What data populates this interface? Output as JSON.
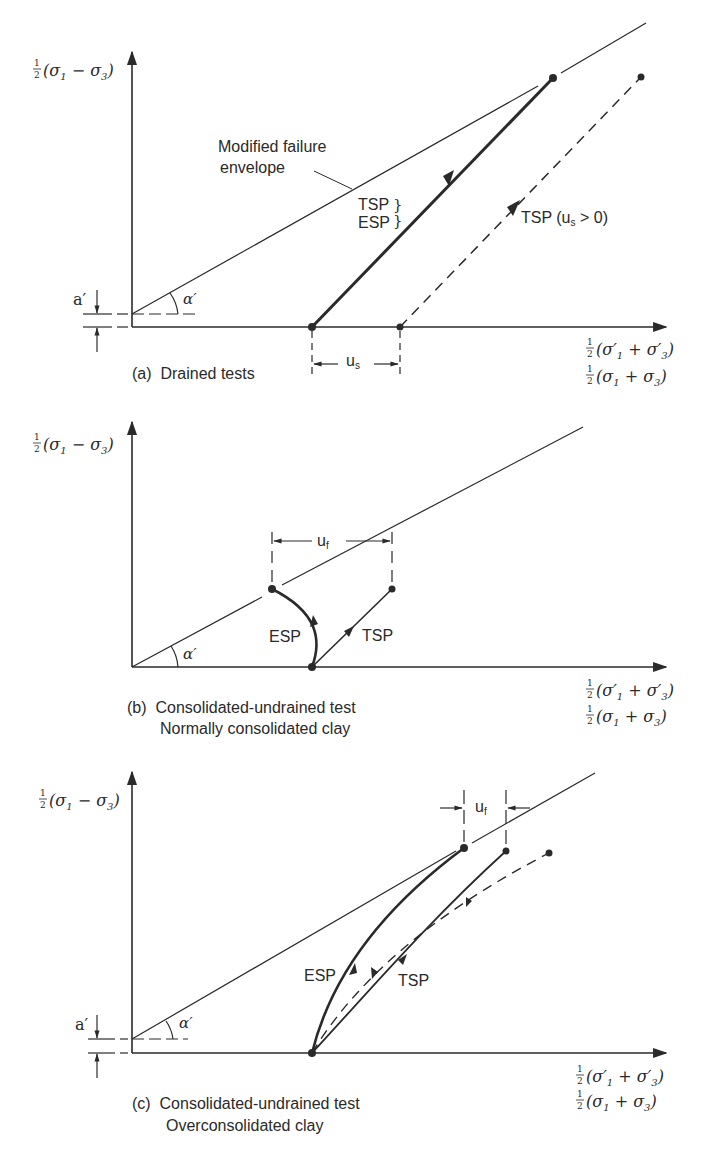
{
  "figure": {
    "panels": [
      {
        "id": "a",
        "caption_lines": [
          "(a)  Drained tests"
        ],
        "y_axis_label": "½(σ₁ − σ₃)",
        "x_axis_label_effective": "½(σ′₁ + σ′₃)",
        "x_axis_label_total": "½(σ₁ + σ₃)",
        "envelope_label_line1": "Modified failure",
        "envelope_label_line2": "envelope",
        "tsp_esp_label_tsp": "TSP",
        "tsp_esp_label_esp": "ESP",
        "brace": "}",
        "dashed_path_label": "TSP (u",
        "dashed_path_label_sub": "s",
        "dashed_path_label_tail": " > 0)",
        "intercept_label": "a′",
        "angle_label": "α′",
        "dimension_label": "u",
        "dimension_label_sub": "s"
      },
      {
        "id": "b",
        "caption_lines": [
          "(b)  Consolidated-undrained test",
          "Normally consolidated clay"
        ],
        "y_axis_label": "½(σ₁ − σ₃)",
        "x_axis_label_effective": "½(σ′₁ + σ′₃)",
        "x_axis_label_total": "½(σ₁ + σ₃)",
        "esp_label": "ESP",
        "tsp_label": "TSP",
        "angle_label": "α′",
        "dimension_label": "u",
        "dimension_label_sub": "f"
      },
      {
        "id": "c",
        "caption_lines": [
          "(c)  Consolidated-undrained test",
          "Overconsolidated clay"
        ],
        "y_axis_label": "½(σ₁ − σ₃)",
        "x_axis_label_effective": "½(σ′₁ + σ′₃)",
        "x_axis_label_total": "½(σ₁ + σ₃)",
        "esp_label": "ESP",
        "tsp_label": "TSP",
        "intercept_label": "a′",
        "angle_label": "α′",
        "dimension_label": "u",
        "dimension_label_sub": "f"
      }
    ],
    "colors": {
      "ink": "#2a2a2a",
      "background": "#ffffff"
    }
  }
}
